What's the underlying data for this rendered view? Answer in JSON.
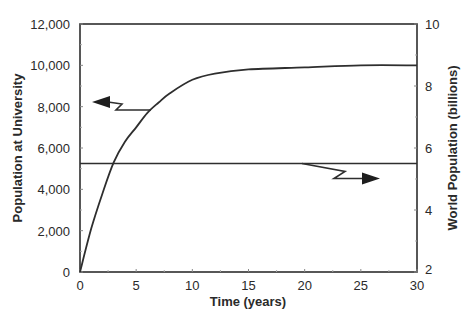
{
  "chart_data": {
    "type": "line",
    "title": "",
    "xlabel": "Time (years)",
    "ylabel": "Population at University",
    "y2label": "World Population (billions)",
    "xlim": [
      0,
      30
    ],
    "ylim": [
      0,
      12000
    ],
    "y2lim": [
      2,
      10
    ],
    "x_ticks": [
      0,
      5,
      10,
      15,
      20,
      25,
      30
    ],
    "x_tick_labels": [
      "0",
      "5",
      "10",
      "15",
      "20",
      "25",
      "30"
    ],
    "y_ticks": [
      0,
      2000,
      4000,
      6000,
      8000,
      10000,
      12000
    ],
    "y_tick_labels": [
      "0",
      "2,000",
      "4,000",
      "6,000",
      "8,000",
      "10,000",
      "12,000"
    ],
    "y2_ticks": [
      2,
      4,
      6,
      8,
      10
    ],
    "y2_tick_labels": [
      "2",
      "4",
      "6",
      "8",
      "10"
    ],
    "grid": false,
    "legend": "none (arrows indicate axis for each series)",
    "series": [
      {
        "name": "Population at University",
        "axis": "left",
        "x": [
          0,
          1,
          2,
          3,
          4,
          5,
          6,
          7,
          8,
          10,
          12,
          15,
          20,
          25,
          30
        ],
        "values": [
          0,
          2100,
          3800,
          5300,
          6300,
          7000,
          7700,
          8200,
          8650,
          9300,
          9600,
          9800,
          9900,
          10000,
          10000
        ]
      },
      {
        "name": "World Population (billions)",
        "axis": "right",
        "x": [
          0,
          30
        ],
        "values": [
          5.5,
          5.5
        ]
      }
    ],
    "annotations": [
      {
        "type": "arrow",
        "direction": "left",
        "points_to": "left axis",
        "from_series": "Population at University",
        "near": [
          6.2,
          7800
        ]
      },
      {
        "type": "arrow",
        "direction": "right",
        "points_to": "right axis",
        "from_series": "World Population (billions)",
        "near": [
          20,
          5.5
        ]
      }
    ]
  },
  "labels": {
    "xlabel": "Time (years)",
    "ylabel": "Population at University",
    "y2label": "World Population (billions)"
  }
}
